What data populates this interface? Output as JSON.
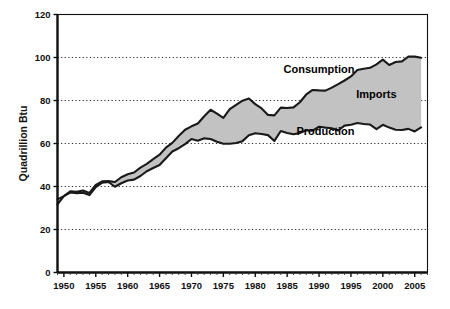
{
  "chart_data": {
    "type": "area",
    "title": "",
    "subtitle": "",
    "xlabel": "",
    "ylabel": "Quadrillion Btu",
    "xlim": [
      1949,
      2007
    ],
    "ylim": [
      0,
      120
    ],
    "ytick_values": [
      0,
      20,
      40,
      60,
      80,
      100,
      120
    ],
    "ytick_labels": [
      "0",
      "20",
      "40",
      "60",
      "80",
      "100",
      "120"
    ],
    "xtick_values": [
      1950,
      1955,
      1960,
      1965,
      1970,
      1975,
      1980,
      1985,
      1990,
      1995,
      2000,
      2005
    ],
    "xtick_labels": [
      "1950",
      "1955",
      "1960",
      "1965",
      "1970",
      "1975",
      "1980",
      "1985",
      "1990",
      "1995",
      "2000",
      "2005"
    ],
    "minor_xtick_interval": 1,
    "grid": "horizontal-dotted",
    "legend_position": "inline-annotations",
    "band_fill_color": "#c2c2c2",
    "line_color": "#1a1a1a",
    "background_color": "#ffffff",
    "annotations": [
      {
        "text": "Consumption",
        "x": 1990,
        "y": 93
      },
      {
        "text": "Imports",
        "x": 1999,
        "y": 81
      },
      {
        "text": "Production",
        "x": 1991,
        "y": 64
      }
    ],
    "x": [
      1949,
      1950,
      1951,
      1952,
      1953,
      1954,
      1955,
      1956,
      1957,
      1958,
      1959,
      1960,
      1961,
      1962,
      1963,
      1964,
      1965,
      1966,
      1967,
      1968,
      1969,
      1970,
      1971,
      1972,
      1973,
      1974,
      1975,
      1976,
      1977,
      1978,
      1979,
      1980,
      1981,
      1982,
      1983,
      1984,
      1985,
      1986,
      1987,
      1988,
      1989,
      1990,
      1991,
      1992,
      1993,
      1994,
      1995,
      1996,
      1997,
      1998,
      1999,
      2000,
      2001,
      2002,
      2003,
      2004,
      2005,
      2006
    ],
    "series": [
      {
        "name": "Consumption",
        "values": [
          34.0,
          35.5,
          37.8,
          37.5,
          38.1,
          37.0,
          40.7,
          42.4,
          42.5,
          42.1,
          44.3,
          45.7,
          46.5,
          48.8,
          50.5,
          52.7,
          54.8,
          58.1,
          60.3,
          63.5,
          66.4,
          68.0,
          69.3,
          72.7,
          75.7,
          73.9,
          71.9,
          76.0,
          78.0,
          79.9,
          80.9,
          78.3,
          76.3,
          73.3,
          73.1,
          76.7,
          76.5,
          76.8,
          79.2,
          82.8,
          84.9,
          84.7,
          84.6,
          86.0,
          87.6,
          89.3,
          91.2,
          94.2,
          94.8,
          95.2,
          96.8,
          99.0,
          96.5,
          97.9,
          98.2,
          100.4,
          100.4,
          99.9
        ]
      },
      {
        "name": "Production",
        "values": [
          31.7,
          35.5,
          37.2,
          36.9,
          37.1,
          36.0,
          39.7,
          41.8,
          42.1,
          39.9,
          41.5,
          42.8,
          43.2,
          44.9,
          47.1,
          48.6,
          50.0,
          53.1,
          56.3,
          57.8,
          59.7,
          62.1,
          61.3,
          62.4,
          62.1,
          60.8,
          59.9,
          59.9,
          60.2,
          61.1,
          63.8,
          64.8,
          64.4,
          63.9,
          61.2,
          65.8,
          64.9,
          64.3,
          64.9,
          66.1,
          66.0,
          67.8,
          67.4,
          67.1,
          66.1,
          68.3,
          68.7,
          69.5,
          69.1,
          68.8,
          66.7,
          68.7,
          67.4,
          66.4,
          66.3,
          66.8,
          65.6,
          67.5
        ]
      },
      {
        "name": "Imports",
        "derived": "Consumption minus Production",
        "values": [
          2.3,
          0.0,
          0.6,
          0.6,
          1.0,
          1.0,
          1.0,
          0.6,
          0.4,
          2.2,
          2.8,
          2.9,
          3.3,
          3.9,
          3.4,
          4.1,
          4.8,
          5.0,
          4.0,
          5.7,
          6.7,
          5.9,
          8.0,
          10.3,
          13.6,
          13.1,
          12.0,
          16.1,
          17.8,
          18.8,
          17.1,
          13.5,
          11.9,
          9.4,
          11.9,
          10.9,
          11.6,
          12.5,
          14.3,
          16.7,
          18.9,
          16.9,
          17.2,
          18.9,
          21.5,
          21.0,
          22.5,
          24.7,
          25.7,
          26.4,
          30.1,
          30.3,
          29.1,
          31.5,
          31.9,
          33.6,
          34.8,
          32.4
        ]
      }
    ]
  }
}
